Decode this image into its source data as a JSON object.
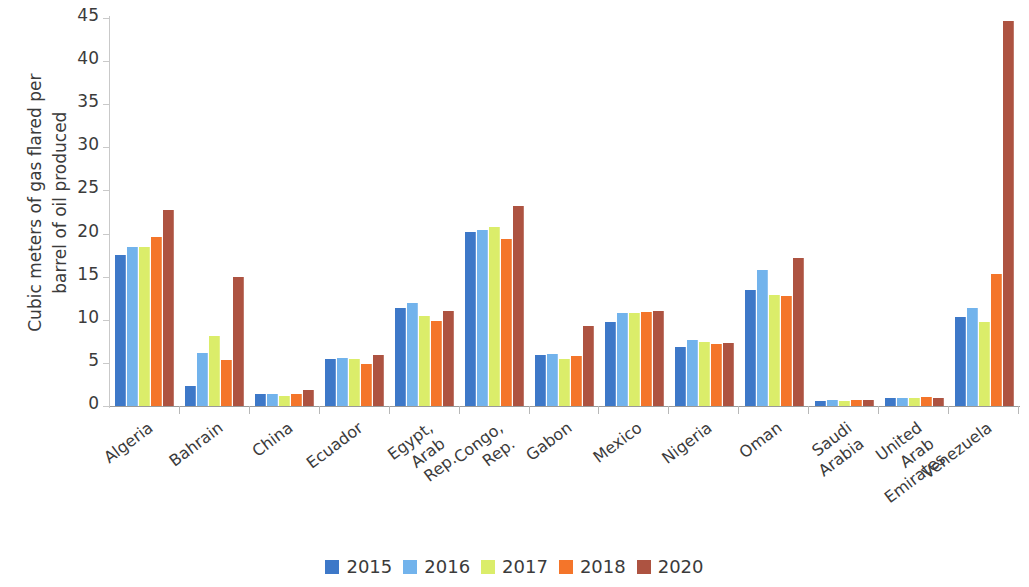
{
  "chart_data": {
    "type": "bar",
    "title": "",
    "subtitle": "",
    "xlabel": "",
    "ylabel": "Cubic meters of gas flared per\nbarrel of oil produced",
    "ylim": [
      0,
      45
    ],
    "yticks": [
      0,
      5,
      10,
      15,
      20,
      25,
      30,
      35,
      40,
      45
    ],
    "grid": false,
    "legend_position": "bottom",
    "categories": [
      "Algeria",
      "Bahrain",
      "China",
      "Ecuador",
      "Egypt, Arab Rep.",
      "Congo, Rep.",
      "Gabon",
      "Mexico",
      "Nigeria",
      "Oman",
      "Saudi Arabia",
      "United Arab\nEmirates",
      "Venezuela"
    ],
    "series": [
      {
        "name": "2015",
        "color": "#3d78c8",
        "values": [
          17.5,
          2.3,
          1.4,
          5.4,
          11.4,
          20.2,
          5.9,
          9.8,
          6.8,
          13.5,
          0.6,
          0.9,
          10.3
        ]
      },
      {
        "name": "2016",
        "color": "#72b3ec",
        "values": [
          18.4,
          6.2,
          1.4,
          5.6,
          11.9,
          20.4,
          6.0,
          10.8,
          7.7,
          15.8,
          0.7,
          0.9,
          11.4
        ]
      },
      {
        "name": "2017",
        "color": "#dbed6a",
        "values": [
          18.4,
          8.1,
          1.2,
          5.4,
          10.4,
          20.8,
          5.4,
          10.8,
          7.4,
          12.9,
          0.6,
          0.9,
          9.7
        ]
      },
      {
        "name": "2018",
        "color": "#f4752a",
        "values": [
          19.6,
          5.3,
          1.4,
          4.9,
          9.9,
          19.4,
          5.8,
          10.9,
          7.2,
          12.8,
          0.7,
          1.0,
          15.3
        ]
      },
      {
        "name": "2020",
        "color": "#ad5341",
        "values": [
          22.7,
          15.0,
          1.9,
          5.9,
          11.0,
          23.2,
          9.3,
          11.0,
          7.3,
          17.2,
          0.7,
          0.9,
          44.6
        ]
      }
    ]
  },
  "axis": {
    "y_tick_labels": [
      "45",
      "40",
      "35",
      "30",
      "25",
      "20",
      "15",
      "10",
      "5",
      "0"
    ]
  }
}
